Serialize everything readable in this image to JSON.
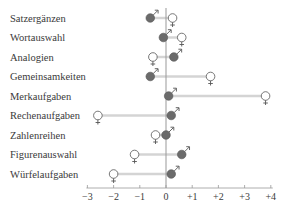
{
  "chart_data": {
    "type": "dot-dumbbell",
    "title": "",
    "xlabel": "",
    "ylabel": "",
    "xlim": [
      -3,
      4
    ],
    "xticks": [
      "-3",
      "-2",
      "-1",
      "0",
      "+1",
      "+2",
      "+3",
      "+4"
    ],
    "xtick_values": [
      -3,
      -2,
      -1,
      0,
      1,
      2,
      3,
      4
    ],
    "categories": [
      "Satzergänzen",
      "Wortauswahl",
      "Analogien",
      "Gemeinsamkeiten",
      "Merkaufgaben",
      "Rechenaufgaben",
      "Zahlenreihen",
      "Figurenauswahl",
      "Würfelaufgaben"
    ],
    "series": [
      {
        "name": "male",
        "symbol": "♂",
        "marker": "filled-circle",
        "color": "#6b6b6b",
        "values": [
          -0.6,
          -0.1,
          0.3,
          -0.6,
          0.1,
          0.2,
          0.0,
          0.6,
          0.2
        ]
      },
      {
        "name": "female",
        "symbol": "♀",
        "marker": "open-circle",
        "color": "#ffffff",
        "values": [
          0.25,
          0.6,
          -0.5,
          1.7,
          3.8,
          -2.6,
          -0.4,
          -1.2,
          -2.0
        ]
      }
    ],
    "grid": false,
    "legend": "none (gender symbols attached to markers)"
  },
  "colors": {
    "male_fill": "#6b6b6b",
    "female_fill": "#ffffff",
    "connector": "#d4d4d4",
    "axis": "#999999",
    "text": "#3a3a3a"
  }
}
